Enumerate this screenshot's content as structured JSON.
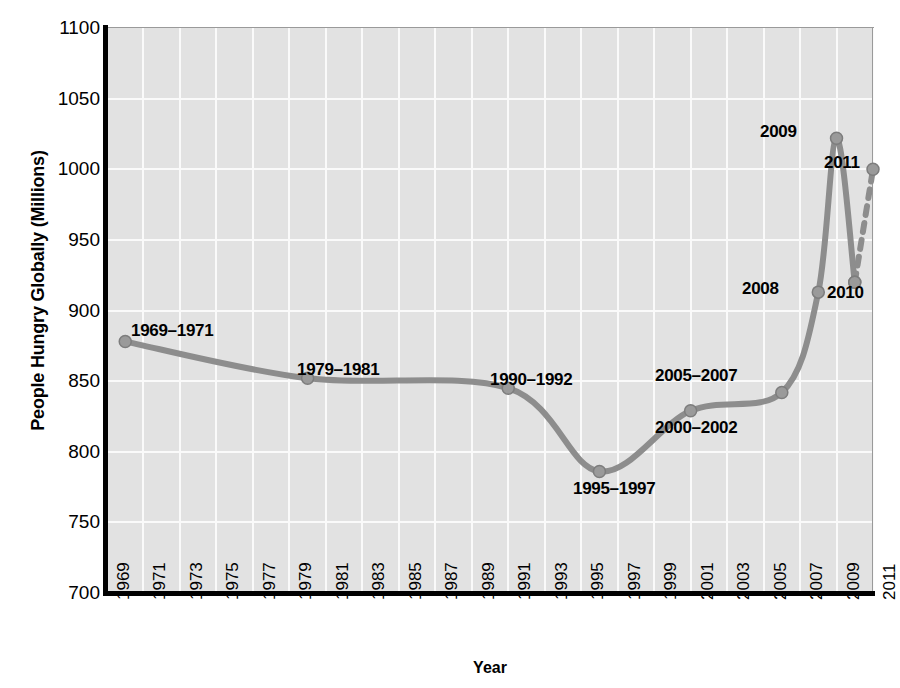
{
  "chart_data": {
    "type": "line",
    "title": "",
    "xlabel": "Year",
    "ylabel": "People Hungry Globally (Millions)",
    "xlim": [
      1969,
      2011
    ],
    "ylim": [
      700,
      1100
    ],
    "grid": true,
    "legend": "none",
    "line_color": "#8d8d8d",
    "marker_color": "#9a9a9a",
    "plot_bg": "#e2e2e2",
    "gridline_color": "#fafafa",
    "yticks": [
      1100,
      1050,
      1000,
      950,
      900,
      850,
      800,
      750,
      700
    ],
    "xticks": [
      1969,
      1971,
      1973,
      1975,
      1977,
      1979,
      1981,
      1983,
      1985,
      1987,
      1989,
      1991,
      1993,
      1995,
      1997,
      1999,
      2001,
      2003,
      2005,
      2007,
      2009,
      2011
    ],
    "series": [
      {
        "name": "People hungry globally",
        "style": "solid",
        "points": [
          {
            "label": "1969–1971",
            "x": 1970,
            "y": 878
          },
          {
            "label": "1979–1981",
            "x": 1980,
            "y": 852
          },
          {
            "label": "1990–1992",
            "x": 1991,
            "y": 845
          },
          {
            "label": "1995–1997",
            "x": 1996,
            "y": 786
          },
          {
            "label": "2000–2002",
            "x": 2001,
            "y": 829
          },
          {
            "label": "2005–2007",
            "x": 2006,
            "y": 842
          },
          {
            "label": "2008",
            "x": 2008,
            "y": 913
          },
          {
            "label": "2009",
            "x": 2009,
            "y": 1022
          },
          {
            "label": "2010",
            "x": 2010,
            "y": 920
          }
        ]
      },
      {
        "name": "Projection",
        "style": "dashed",
        "points": [
          {
            "label": "2010",
            "x": 2010,
            "y": 920
          },
          {
            "label": "2011",
            "x": 2011,
            "y": 1000
          }
        ]
      }
    ],
    "annotations": [
      {
        "text": "1969–1971",
        "x": 131,
        "y": 321
      },
      {
        "text": "1979–1981",
        "x": 297,
        "y": 360
      },
      {
        "text": "1990–1992",
        "x": 490,
        "y": 370
      },
      {
        "text": "1995–1997",
        "x": 573,
        "y": 479
      },
      {
        "text": "2000–2002",
        "x": 655,
        "y": 418
      },
      {
        "text": "2005–2007",
        "x": 655,
        "y": 366
      },
      {
        "text": "2008",
        "x": 742,
        "y": 279
      },
      {
        "text": "2009",
        "x": 760,
        "y": 122
      },
      {
        "text": "2010",
        "x": 827,
        "y": 283
      },
      {
        "text": "2011",
        "x": 824,
        "y": 153
      }
    ]
  }
}
